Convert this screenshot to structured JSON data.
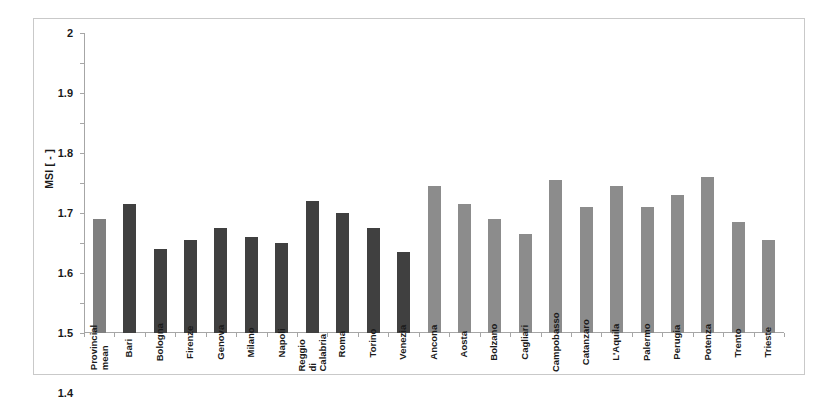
{
  "chart_data": {
    "type": "bar",
    "title": "",
    "subtitle": "",
    "xlabel": "",
    "ylabel": "MSI [ - ]",
    "ylim": [
      1,
      2
    ],
    "ytick_step": 0.1,
    "yticks": [
      "2",
      "1.9",
      "1.8",
      "1.7",
      "1.6",
      "1.5",
      "1.4",
      "1.3",
      "1.2",
      "1.1",
      "1"
    ],
    "grid": false,
    "legend": "none",
    "categories": [
      "Provincial mean",
      "Bari",
      "Bologna",
      "Firenze",
      "Genova",
      "Milano",
      "Napoli",
      "Reggio di Calabria",
      "Roma",
      "Torino",
      "Venezia",
      "Ancona",
      "Aosta",
      "Bolzano",
      "Cagliari",
      "Campobasso",
      "Catanzaro",
      "L'Aquila",
      "Palermo",
      "Perugia",
      "Potenza",
      "Trento",
      "Trieste"
    ],
    "values": [
      1.38,
      1.43,
      1.28,
      1.31,
      1.35,
      1.32,
      1.3,
      1.44,
      1.4,
      1.35,
      1.27,
      1.49,
      1.43,
      1.38,
      1.33,
      1.51,
      1.42,
      1.49,
      1.42,
      1.46,
      1.52,
      1.37,
      1.31
    ],
    "bar_colors": [
      "#7f7f7f",
      "#404040",
      "#404040",
      "#404040",
      "#404040",
      "#404040",
      "#404040",
      "#404040",
      "#404040",
      "#404040",
      "#404040",
      "#8c8c8c",
      "#8c8c8c",
      "#8c8c8c",
      "#8c8c8c",
      "#8c8c8c",
      "#8c8c8c",
      "#8c8c8c",
      "#8c8c8c",
      "#8c8c8c",
      "#8c8c8c",
      "#8c8c8c",
      "#8c8c8c"
    ],
    "colors": {
      "mean_bar": "#7f7f7f",
      "metropolitan_bar": "#404040",
      "regional_bar": "#8c8c8c",
      "axis": "#a6a6a6",
      "frame": "#c9c9c9",
      "text": "#1a1a1a",
      "background": "#ffffff"
    }
  }
}
